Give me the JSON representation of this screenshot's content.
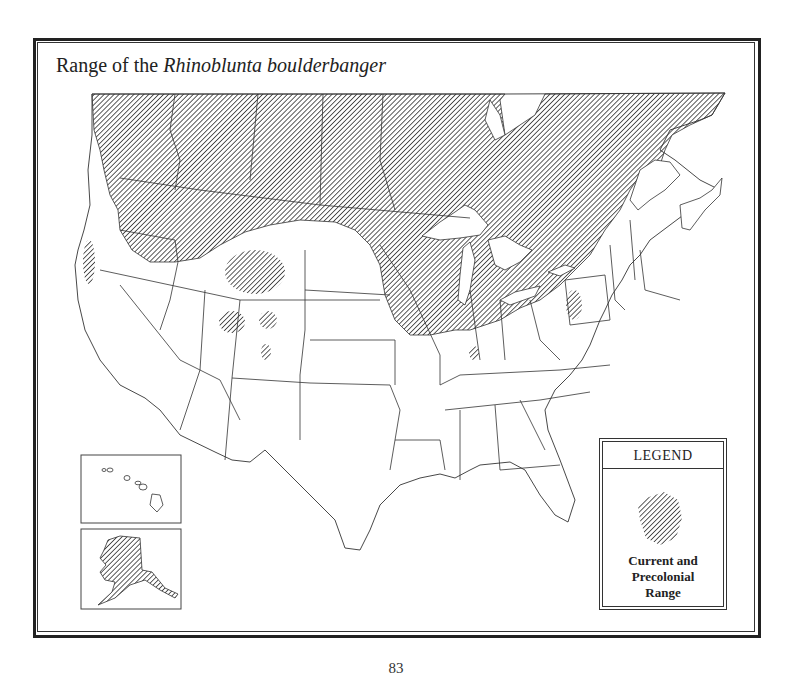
{
  "title": {
    "prefix": "Range of the ",
    "species": "Rhinoblunta boulderbanger"
  },
  "legend": {
    "heading": "LEGEND",
    "entries": [
      {
        "label_line1": "Current and",
        "label_line2": "Precolonial",
        "label_line3": "Range",
        "pattern": "diagonal-hatch"
      }
    ]
  },
  "insets": [
    {
      "name": "Hawaii",
      "shaded": false
    },
    {
      "name": "Alaska",
      "shaded": true
    }
  ],
  "colors": {
    "hatch": "#333333",
    "border": "#222222",
    "background": "#ffffff"
  },
  "page_number": "83"
}
